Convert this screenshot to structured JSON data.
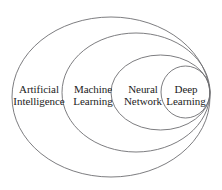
{
  "figure": {
    "kind": "nested-set-venn-diagram",
    "background_color": "#ffffff",
    "stroke_color": "#6e6e72",
    "text_color": "#1c1c1c"
  },
  "chart_data": {
    "type": "diagram",
    "title": "",
    "subtitle": "",
    "xlabel": "",
    "ylabel": "",
    "grid": false,
    "legend": "none",
    "relationship": "each set is a proper subset of the one enclosing it, all tangent on the right edge",
    "sets": [
      {
        "id": "artificial-intelligence",
        "level": 1,
        "label_lines": [
          "Artificial",
          "Intelligence"
        ],
        "label_text": "Artificial Intelligence",
        "cx": 111,
        "cy": 97,
        "rx": 99,
        "ry": 80
      },
      {
        "id": "machine-learning",
        "level": 2,
        "label_lines": [
          "Machine",
          "Learning"
        ],
        "label_text": "Machine Learning",
        "cx": 136,
        "cy": 92.5,
        "rx": 74,
        "ry": 59.5
      },
      {
        "id": "neural-network",
        "level": 3,
        "label_lines": [
          "Neural",
          "Network"
        ],
        "label_text": "Neural Network",
        "cx": 160.5,
        "cy": 92.5,
        "rx": 49.5,
        "ry": 37.5
      },
      {
        "id": "deep-learning",
        "level": 4,
        "label_lines": [
          "Deep",
          "Learning"
        ],
        "label_text": "Deep Learning",
        "cx": 185.5,
        "cy": 92,
        "rx": 24.5,
        "ry": 26
      }
    ]
  },
  "labels": {
    "artificial_intelligence": {
      "line1": "Artificial",
      "line2": "Intelligence"
    },
    "machine_learning": {
      "line1": "Machine",
      "line2": "Learning"
    },
    "neural_network": {
      "line1": "Neural",
      "line2": "Network"
    },
    "deep_learning": {
      "line1": "Deep",
      "line2": "Learning"
    }
  }
}
